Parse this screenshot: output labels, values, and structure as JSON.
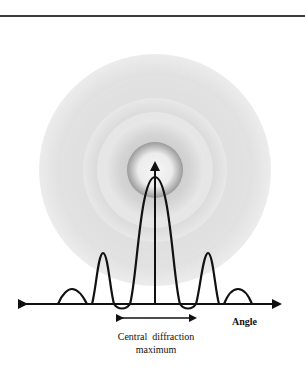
{
  "figure": {
    "axis_label": "Angle",
    "caption_line1": "Central  diffraction",
    "caption_line2": "maximum"
  },
  "pattern": {
    "center": [
      155,
      170
    ],
    "rings": [
      {
        "r": 116,
        "color": "#e9e9e9"
      },
      {
        "r": 95,
        "color": "#d6d6d6"
      },
      {
        "r": 70,
        "color": "#e4e4e4"
      },
      {
        "r": 56,
        "color": "#c4c4c4"
      },
      {
        "r": 30,
        "color": "#eeeeee"
      }
    ]
  },
  "colors": {
    "line": "#111111",
    "rule": "#3a3a3a"
  }
}
